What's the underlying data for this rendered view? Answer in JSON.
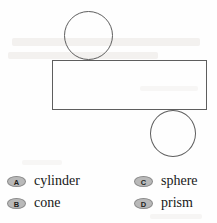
{
  "figure": {
    "name": "net-of-a-solid",
    "stroke_color": "#5e5e5e",
    "parts": [
      {
        "id": "circle-top",
        "shape": "circle",
        "x": 64,
        "y": 11,
        "width": 49,
        "height": 49
      },
      {
        "id": "rect-body",
        "shape": "rectangle",
        "x": 52,
        "y": 60,
        "width": 155,
        "height": 50
      },
      {
        "id": "circle-bottom",
        "shape": "circle",
        "x": 150,
        "y": 110,
        "width": 46,
        "height": 47
      }
    ]
  },
  "answer_options": [
    {
      "letter": "A",
      "label": "cylinder",
      "column": "left",
      "row": 1
    },
    {
      "letter": "B",
      "label": "cone",
      "column": "left",
      "row": 2
    },
    {
      "letter": "C",
      "label": "sphere",
      "column": "right",
      "row": 1
    },
    {
      "letter": "D",
      "label": "prism",
      "column": "right",
      "row": 2
    }
  ],
  "colors": {
    "badge_fill": "#b9b9b9",
    "badge_border": "#8a8a8a",
    "text": "#181818",
    "figure_stroke": "#5e5e5e",
    "page_background": "#fefefe"
  }
}
